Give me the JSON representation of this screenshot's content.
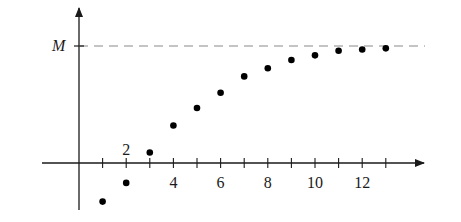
{
  "chart_data": {
    "type": "scatter",
    "title": "",
    "xlabel": "",
    "ylabel": "",
    "x": [
      1,
      2,
      3,
      4,
      5,
      6,
      7,
      8,
      9,
      10,
      11,
      12,
      13
    ],
    "y": [
      -0.33,
      -0.17,
      0.09,
      0.32,
      0.47,
      0.6,
      0.74,
      0.81,
      0.88,
      0.92,
      0.96,
      0.97,
      0.98
    ],
    "y_units": "fraction of M (estimated)",
    "asymptote": {
      "label": "M",
      "value": 1.0,
      "style": "dashed"
    },
    "x_tick_labels": [
      {
        "value": 2,
        "label": "2",
        "position": "above"
      },
      {
        "value": 4,
        "label": "4",
        "position": "below"
      },
      {
        "value": 6,
        "label": "6",
        "position": "below"
      },
      {
        "value": 8,
        "label": "8",
        "position": "below"
      },
      {
        "value": 10,
        "label": "10",
        "position": "below"
      },
      {
        "value": 12,
        "label": "12",
        "position": "below"
      }
    ],
    "x_ticks": [
      1,
      2,
      3,
      4,
      5,
      6,
      7,
      8,
      9,
      10,
      11,
      12,
      13
    ],
    "xlim": [
      -1,
      14.5
    ],
    "grid": false,
    "legend": null
  },
  "colors": {
    "axis": "#1a1a1a",
    "dots": "#000000",
    "asymptote": "#8a8a8a",
    "background": "#ffffff"
  }
}
